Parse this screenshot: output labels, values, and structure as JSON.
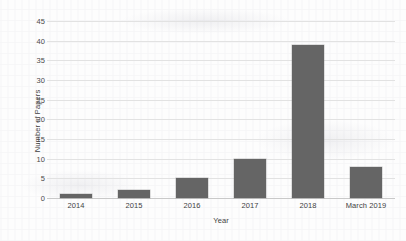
{
  "chart_data": {
    "type": "bar",
    "title": "",
    "xlabel": "Year",
    "ylabel": "Number of Papers",
    "categories": [
      "2014",
      "2015",
      "2016",
      "2017",
      "2018",
      "March 2019"
    ],
    "values": [
      1,
      2,
      5,
      10,
      39,
      8
    ],
    "yticks": [
      0,
      5,
      10,
      15,
      20,
      25,
      30,
      35,
      40,
      45
    ],
    "ylim": [
      0,
      45
    ],
    "grid": true,
    "legend": "none",
    "bar_color": "#656565",
    "gridline_color": "#e2e2e2",
    "axis_color": "#c9c9c9",
    "text_color": "#3f3f3f"
  }
}
